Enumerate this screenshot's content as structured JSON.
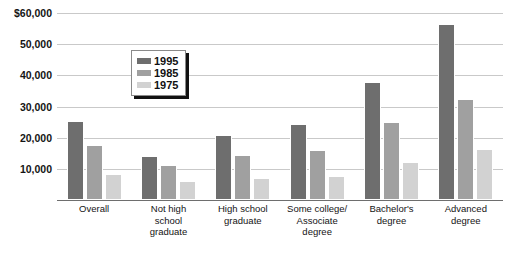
{
  "chart_data": {
    "type": "bar",
    "title": "",
    "xlabel": "",
    "ylabel": "",
    "ylim": [
      0,
      60000
    ],
    "grid": true,
    "legend_position": "upper-center-left",
    "categories": [
      "Overall",
      "Not high school graduate",
      "High school graduate",
      "Some college/ Associate degree",
      "Bachelor's degree",
      "Advanced degree"
    ],
    "series": [
      {
        "name": "1995",
        "color": "#6e6e6e",
        "values": [
          25500,
          14000,
          21000,
          24500,
          37800,
          56500
        ]
      },
      {
        "name": "1985",
        "color": "#a0a0a0",
        "values": [
          17800,
          11300,
          14500,
          16000,
          25000,
          32300
        ]
      },
      {
        "name": "1975",
        "color": "#d2d2d2",
        "values": [
          8200,
          6200,
          7200,
          7700,
          12200,
          16300
        ]
      }
    ],
    "ticks": [
      {
        "value": 60000,
        "label": "$60,000"
      },
      {
        "value": 50000,
        "label": "50,000"
      },
      {
        "value": 40000,
        "label": "40,000"
      },
      {
        "value": 30000,
        "label": "30,000"
      },
      {
        "value": 20000,
        "label": "20,000"
      },
      {
        "value": 10000,
        "label": "10,000"
      }
    ],
    "xtick_lines": [
      [
        "Overall"
      ],
      [
        "Not high",
        "school",
        "graduate"
      ],
      [
        "High school",
        "graduate"
      ],
      [
        "Some college/",
        "Associate",
        "degree"
      ],
      [
        "Bachelor's",
        "degree"
      ],
      [
        "Advanced",
        "degree"
      ]
    ]
  },
  "legend": {
    "entries": [
      {
        "label": "1995",
        "color": "#6e6e6e"
      },
      {
        "label": "1985",
        "color": "#a0a0a0"
      },
      {
        "label": "1975",
        "color": "#d2d2d2"
      }
    ]
  },
  "colors": {
    "gridline": "#c9c9c9",
    "axis": "#6e6e6e",
    "background": "#ffffff",
    "text": "#141414"
  }
}
